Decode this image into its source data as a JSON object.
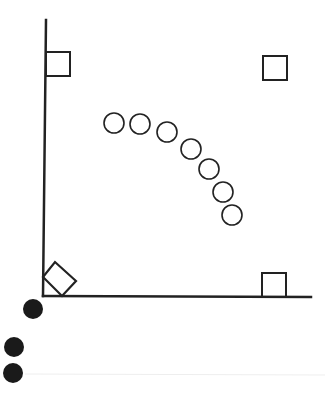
{
  "canvas": {
    "width": 325,
    "height": 400,
    "background": "#ffffff"
  },
  "colors": {
    "stroke": "#222222",
    "fill_dark": "#1a1a1a",
    "faint_line": "#eeeeee"
  },
  "axes": {
    "y_axis": {
      "x1": 46,
      "y1": 20,
      "x2": 43,
      "y2": 296
    },
    "x_axis": {
      "x1": 43,
      "y1": 296,
      "x2": 311,
      "y2": 297
    },
    "stroke_width": 2.5
  },
  "squares": [
    {
      "name": "square-top-left",
      "x": 46,
      "y": 52,
      "size": 24
    },
    {
      "name": "square-top-right",
      "x": 263,
      "y": 56,
      "size": 24
    },
    {
      "name": "square-bottom-right",
      "x": 262,
      "y": 273,
      "size": 24
    }
  ],
  "diamond": {
    "name": "rotated-square-origin",
    "points": "43,277 55,262 76,281 62,296"
  },
  "open_circles": [
    {
      "cx": 114,
      "cy": 123,
      "r": 10
    },
    {
      "cx": 140,
      "cy": 124,
      "r": 10
    },
    {
      "cx": 167,
      "cy": 132,
      "r": 10
    },
    {
      "cx": 191,
      "cy": 149,
      "r": 10
    },
    {
      "cx": 209,
      "cy": 169,
      "r": 10
    },
    {
      "cx": 223,
      "cy": 192,
      "r": 10
    },
    {
      "cx": 232,
      "cy": 215,
      "r": 10
    }
  ],
  "filled_circles": [
    {
      "cx": 33,
      "cy": 309,
      "r": 10
    },
    {
      "cx": 14,
      "cy": 347,
      "r": 10
    },
    {
      "cx": 13,
      "cy": 373,
      "r": 10
    }
  ],
  "faint_line": {
    "x1": 25,
    "y1": 374,
    "x2": 325,
    "y2": 375
  }
}
